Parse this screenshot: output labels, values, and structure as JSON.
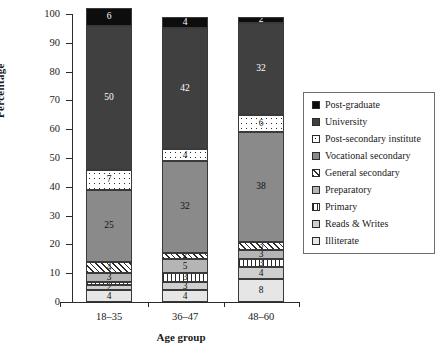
{
  "chart_data": {
    "type": "bar",
    "subtype": "stacked-bar-100",
    "title": "",
    "xlabel": "Age group",
    "ylabel": "Percentage",
    "ylim": [
      0,
      100
    ],
    "ytick_step": 10,
    "yticks": [
      0,
      10,
      20,
      30,
      40,
      50,
      60,
      70,
      80,
      90,
      100
    ],
    "grid": false,
    "legend_position": "right",
    "categories": [
      "18–35",
      "36–47",
      "48–60"
    ],
    "series": [
      {
        "name": "Illiterate",
        "values": [
          4,
          4,
          8
        ],
        "fill": "#e6e6e6",
        "pattern": "solid"
      },
      {
        "name": "Reads & Writes",
        "values": [
          2,
          3,
          4
        ],
        "fill": "#cfcfcf",
        "pattern": "solid"
      },
      {
        "name": "Primary",
        "values": [
          1,
          3,
          3
        ],
        "fill": "#ffffff",
        "pattern": "vertical-lines"
      },
      {
        "name": "Preparatory",
        "values": [
          3,
          5,
          3
        ],
        "fill": "#b5b5b5",
        "pattern": "solid"
      },
      {
        "name": "General secondary",
        "values": [
          4,
          2,
          3
        ],
        "fill": "#ffffff",
        "pattern": "diagonal-hatch"
      },
      {
        "name": "Vocational secondary",
        "values": [
          25,
          32,
          38
        ],
        "fill": "#8a8a8a",
        "pattern": "solid"
      },
      {
        "name": "Post-secondary institute",
        "values": [
          7,
          4,
          6
        ],
        "fill": "#ffffff",
        "pattern": "dots"
      },
      {
        "name": "University",
        "values": [
          50,
          42,
          32
        ],
        "fill": "#404040",
        "pattern": "solid"
      },
      {
        "name": "Post-graduate",
        "values": [
          6,
          4,
          2
        ],
        "fill": "#0d0d0d",
        "pattern": "solid"
      }
    ],
    "legend_order_top_to_bottom": [
      "Post-graduate",
      "University",
      "Post-secondary institute",
      "Vocational secondary",
      "General secondary",
      "Preparatory",
      "Primary",
      "Reads & Writes",
      "Illiterate"
    ]
  },
  "axes": {
    "y_title": "Percentage",
    "x_title": "Age group",
    "y_tick_labels": [
      "0",
      "10",
      "20",
      "30",
      "40",
      "50",
      "60",
      "70",
      "80",
      "90",
      "100"
    ],
    "x_tick_labels": [
      "18–35",
      "36–47",
      "48–60"
    ]
  },
  "legend": {
    "items": [
      {
        "label": "Post-graduate"
      },
      {
        "label": "University"
      },
      {
        "label": "Post-secondary institute"
      },
      {
        "label": "Vocational secondary"
      },
      {
        "label": "General secondary"
      },
      {
        "label": "Preparatory"
      },
      {
        "label": "Primary"
      },
      {
        "label": "Reads & Writes"
      },
      {
        "label": "Illiterate"
      }
    ]
  },
  "colors": {
    "post_graduate": "#0d0d0d",
    "university": "#404040",
    "post_secondary_institute": "#ffffff",
    "vocational_secondary": "#8a8a8a",
    "general_secondary": "#ffffff",
    "preparatory": "#b5b5b5",
    "primary": "#ffffff",
    "reads_writes": "#cfcfcf",
    "illiterate": "#e6e6e6",
    "axis": "#2b2b2b",
    "background": "#ffffff"
  }
}
